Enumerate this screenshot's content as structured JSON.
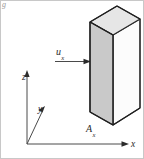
{
  "figure": {
    "background_color": "#ffffff",
    "line_color": "#2b2b2b",
    "frame_color": "#bdbdbd",
    "slab_front_fill": "#c9c9c9",
    "slab_top_fill": "#e2e2e2",
    "slab_side_fill": "#fbfbfb"
  },
  "labels": {
    "velocity": "u",
    "velocity_subscript": "x",
    "area": "A",
    "area_subscript": "x",
    "axis_x": "x",
    "axis_y": "y",
    "axis_z": "z",
    "corner_mark": "g"
  },
  "diagram_data": {
    "type": "technical-line-drawing",
    "elements": [
      {
        "name": "coordinate-axes",
        "origin_px": [
          27,
          144
        ],
        "axes": [
          {
            "label": "z",
            "direction": "up",
            "tip_px": [
              27,
              72
            ]
          },
          {
            "label": "y",
            "direction": "diagonal-up-right",
            "tip_px": [
              45,
              105
            ]
          },
          {
            "label": "x",
            "direction": "right",
            "tip_px": [
              128,
              144
            ]
          }
        ]
      },
      {
        "name": "velocity-arrow",
        "label": "u_x",
        "tail_px": [
          55,
          62
        ],
        "head_px": [
          91,
          62
        ],
        "direction": "right"
      },
      {
        "name": "slab",
        "description": "rectangular plate / control volume drawn in oblique projection",
        "front_face_px": [
          [
            90,
            22
          ],
          [
            90,
            112
          ],
          [
            113,
            125
          ],
          [
            113,
            35
          ]
        ],
        "top_face_px": [
          [
            90,
            22
          ],
          [
            117,
            6
          ],
          [
            140,
            19
          ],
          [
            113,
            35
          ]
        ],
        "side_face_px": [
          [
            113,
            35
          ],
          [
            140,
            19
          ],
          [
            140,
            108
          ],
          [
            113,
            125
          ]
        ]
      }
    ]
  }
}
